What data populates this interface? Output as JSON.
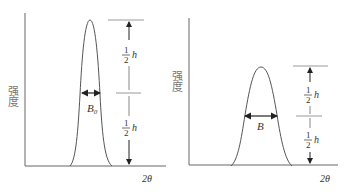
{
  "panels": [
    {
      "id": "narrow-peak",
      "ylabel": "强度",
      "xlabel": "2θ",
      "width_label": "B",
      "width_sub": "0",
      "half_top": {
        "num": "1",
        "den": "2",
        "var": "h"
      },
      "half_bottom": {
        "num": "1",
        "den": "2",
        "var": "h"
      }
    },
    {
      "id": "broad-peak",
      "ylabel": "强度",
      "xlabel": "2θ",
      "width_label": "B",
      "width_sub": "",
      "half_top": {
        "num": "1",
        "den": "2",
        "var": "h"
      },
      "half_bottom": {
        "num": "1",
        "den": "2",
        "var": "h"
      }
    }
  ],
  "colors": {
    "line": "#555555",
    "arrow": "#222222",
    "guide": "#999999"
  }
}
